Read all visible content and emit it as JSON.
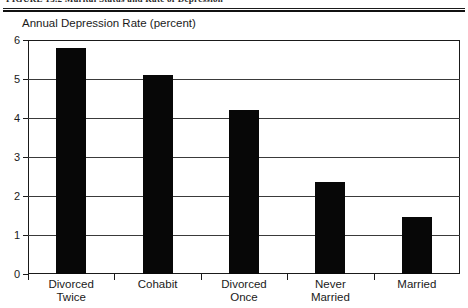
{
  "figure": {
    "caption": "FIGURE 13.2    Marital Status and Rate of Depression"
  },
  "chart_data": {
    "type": "bar",
    "title": "",
    "axis_title": "Annual Depression Rate (percent)",
    "categories": [
      "Divorced\nTwice",
      "Cohabit",
      "Divorced\nOnce",
      "Never\nMarried",
      "Married"
    ],
    "category_labels_flat": [
      "Divorced Twice",
      "Cohabit",
      "Divorced Once",
      "Never Married",
      "Married"
    ],
    "values": [
      5.8,
      5.1,
      4.2,
      2.35,
      1.47
    ],
    "xlabel": "",
    "ylabel": "Annual Depression Rate (percent)",
    "ylim": [
      0,
      6
    ],
    "yticks": [
      0,
      1,
      2,
      3,
      4,
      5,
      6
    ],
    "ytick_labels": [
      "0",
      "1",
      "2",
      "3",
      "4",
      "5",
      "6"
    ],
    "grid": true,
    "legend": null,
    "bar_color": "#070707",
    "axis_color": "#1a1a1a",
    "background": "#ffffff"
  }
}
